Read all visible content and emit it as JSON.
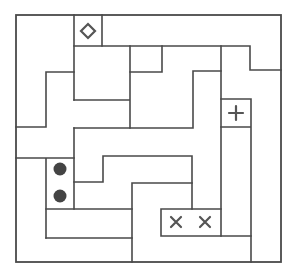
{
  "puzzle": {
    "type": "region-division grid puzzle",
    "board": {
      "left": 16,
      "top": 15,
      "right": 281,
      "bottom": 262
    },
    "colors": {
      "wall": "#4a4a4a",
      "glyph": "#555555",
      "dot": "#444444",
      "background": "#ffffff"
    },
    "symbols": [
      {
        "name": "diamond",
        "icon": "diamond-icon",
        "glyph": "◇",
        "x": 88,
        "y": 31
      },
      {
        "name": "plus",
        "icon": "plus-icon",
        "glyph": "+",
        "x": 236,
        "y": 113
      },
      {
        "name": "dot-1",
        "icon": "filled-circle-icon",
        "glyph": "●",
        "x": 60,
        "y": 169
      },
      {
        "name": "dot-2",
        "icon": "filled-circle-icon",
        "glyph": "●",
        "x": 60,
        "y": 196
      },
      {
        "name": "cross-1",
        "icon": "cross-icon",
        "glyph": "×",
        "x": 176,
        "y": 222
      },
      {
        "name": "cross-2",
        "icon": "cross-icon",
        "glyph": "×",
        "x": 205,
        "y": 222
      }
    ],
    "symbol_count": 6
  }
}
